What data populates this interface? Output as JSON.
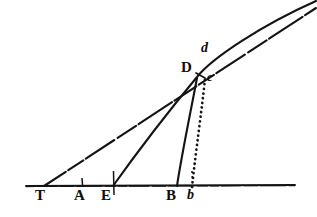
{
  "figure": {
    "domain": "diagram",
    "kind": "geometric-line-diagram",
    "background_color": "#ffffff",
    "ink_color": "#141414",
    "width": 317,
    "height": 217,
    "labels": [
      {
        "id": "label-T",
        "text": "T",
        "style": "upper",
        "x": 35,
        "y": 188
      },
      {
        "id": "label-A",
        "text": "A",
        "style": "upper",
        "x": 74,
        "y": 188
      },
      {
        "id": "label-E",
        "text": "E",
        "style": "upper",
        "x": 101,
        "y": 188
      },
      {
        "id": "label-B",
        "text": "B",
        "style": "upper",
        "x": 167,
        "y": 188
      },
      {
        "id": "label-b",
        "text": "b",
        "style": "lower",
        "x": 187,
        "y": 188
      },
      {
        "id": "label-D",
        "text": "D",
        "style": "upper",
        "x": 182,
        "y": 61
      },
      {
        "id": "label-d",
        "text": "d",
        "style": "lower",
        "x": 200,
        "y": 42
      },
      {
        "id": "label-c",
        "text": "c",
        "style": "lower-sm",
        "x": 207,
        "y": 72
      }
    ],
    "points": {
      "T": {
        "x": 44,
        "y": 186
      },
      "A": {
        "x": 82,
        "y": 186
      },
      "E": {
        "x": 113,
        "y": 186
      },
      "B": {
        "x": 177,
        "y": 186
      },
      "b": {
        "x": 192,
        "y": 186
      },
      "D": {
        "x": 198,
        "y": 74
      },
      "c": {
        "x": 205,
        "y": 76
      },
      "d": {
        "x": 214,
        "y": 57
      }
    },
    "baseline": {
      "id": "baseline-axis",
      "x1": 26,
      "y1": 186,
      "x2": 295,
      "y2": 185,
      "description": "horizontal base line"
    },
    "ticks": [
      {
        "id": "tick-A",
        "x": 82,
        "y_top": 178,
        "y_bottom": 186
      },
      {
        "id": "tick-E",
        "x": 113,
        "y_top": 172,
        "y_bottom": 194
      },
      {
        "id": "tick-b",
        "x": 192,
        "y_top": 172,
        "y_bottom": 186
      }
    ],
    "strokes": [
      {
        "id": "tangent-line-T-d",
        "description": "long straight tangent line from T through D to d, drawn with broken/dashed scan texture",
        "dash": "22 4 14 3 30 4 18 3",
        "width": 2.1,
        "path": "M 44 186 L 316 8"
      },
      {
        "id": "curve-E-D",
        "description": "curve rising from E through D continuing to upper right",
        "dash": "none",
        "width": 2.0,
        "path": "M 113 186 C 135 156 170 110 198 76 C 212 58 260 26 316 2"
      },
      {
        "id": "chord-B-D",
        "description": "solid straight line from B up to D",
        "dash": "none",
        "width": 2.0,
        "path": "M 177 186 L 198 76"
      },
      {
        "id": "dotted-b-c",
        "description": "dotted vertical-ish line from b up to c",
        "dash": "1.6 4.2",
        "width": 2.6,
        "path": "M 192 186 C 196 150 202 110 205 78"
      },
      {
        "id": "tick-mark-d-c",
        "description": "short dash joining D to c",
        "dash": "none",
        "width": 1.6,
        "path": "M 198 74 L 206 78"
      }
    ]
  }
}
